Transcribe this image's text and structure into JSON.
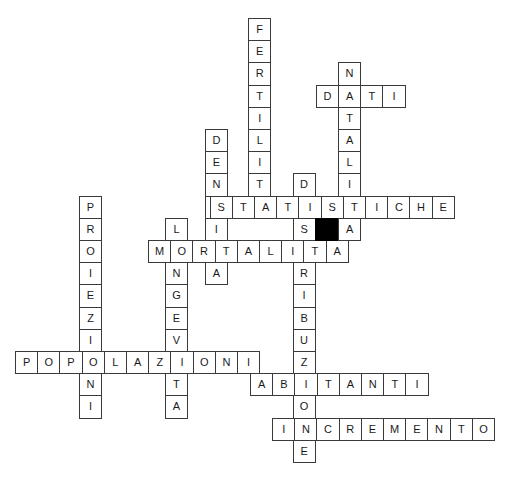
{
  "puzzle": {
    "type": "crossword",
    "title": "",
    "grid": {
      "origin_x": 15,
      "origin_y": 18,
      "cell_size": 22.2,
      "border_color": "#3a3a3a",
      "cell_fill": "#ffffff",
      "blocked_fill": "#000000",
      "text_color": "#1a1a1a"
    },
    "entries": [
      {
        "id": "fertilita",
        "answer": "FERTILITA",
        "direction": "down",
        "col": 10.5,
        "row": 0,
        "letters": [
          "F",
          "E",
          "R",
          "T",
          "I",
          "L",
          "I",
          "T",
          "A"
        ]
      },
      {
        "id": "natalita",
        "answer": "NATALITA",
        "direction": "down",
        "col": 14.55,
        "row": 2,
        "letters": [
          "N",
          "A",
          "T",
          "A",
          "L",
          "I",
          "T",
          "A"
        ]
      },
      {
        "id": "dati",
        "answer": "DATI",
        "direction": "across",
        "col": 13.55,
        "row": 3,
        "letters": [
          "D",
          "A",
          "T",
          "I"
        ]
      },
      {
        "id": "densita",
        "answer": "DENSITA",
        "direction": "down",
        "col": 8.55,
        "row": 5,
        "letters": [
          "D",
          "E",
          "N",
          "S",
          "I",
          "T",
          "A"
        ]
      },
      {
        "id": "distribuzione",
        "answer": "DISTRIBUZIONE",
        "direction": "down",
        "col": 12.5,
        "row": 7,
        "letters": [
          "D",
          "I",
          "S",
          "T",
          "R",
          "I",
          "B",
          "U",
          "Z",
          "I",
          "O",
          "N",
          "E"
        ]
      },
      {
        "id": "statistiche",
        "answer": "STATISTICHE",
        "direction": "across",
        "col": 8.77,
        "row": 8,
        "letters": [
          "S",
          "T",
          "A",
          "T",
          "I",
          "S",
          "T",
          "I",
          "C",
          "H",
          "E"
        ]
      },
      {
        "id": "proiezioni",
        "answer": "PROIEZIONI",
        "direction": "down",
        "col": 2.88,
        "row": 8,
        "letters": [
          "P",
          "R",
          "O",
          "I",
          "E",
          "Z",
          "I",
          "O",
          "N",
          "I"
        ]
      },
      {
        "id": "longevita",
        "answer": "LONGEVITA",
        "direction": "down",
        "col": 6.75,
        "row": 9,
        "letters": [
          "L",
          "O",
          "N",
          "G",
          "E",
          "V",
          "I",
          "T",
          "A"
        ]
      },
      {
        "id": "mortalita",
        "answer": "MORTALITA",
        "direction": "across",
        "col": 5.99,
        "row": 10,
        "letters": [
          "M",
          "O",
          "R",
          "T",
          "A",
          "L",
          "I",
          "T",
          "A"
        ]
      },
      {
        "id": "popolazioni",
        "answer": "POPOLAZIONI",
        "direction": "across",
        "col": 0,
        "row": 15,
        "letters": [
          "P",
          "O",
          "P",
          "O",
          "L",
          "A",
          "Z",
          "I",
          "O",
          "N",
          "I"
        ]
      },
      {
        "id": "abitanti",
        "answer": "ABITANTI",
        "direction": "across",
        "col": 10.59,
        "row": 16,
        "letters": [
          "A",
          "B",
          "I",
          "T",
          "A",
          "N",
          "T",
          "I"
        ]
      },
      {
        "id": "incremento",
        "answer": "INCREMENTO",
        "direction": "across",
        "col": 11.58,
        "row": 18,
        "letters": [
          "I",
          "N",
          "C",
          "R",
          "E",
          "M",
          "E",
          "N",
          "T",
          "O"
        ]
      }
    ],
    "blocked_cells": [
      {
        "id": "blocked-1",
        "col": 13.5,
        "row": 9
      }
    ]
  }
}
